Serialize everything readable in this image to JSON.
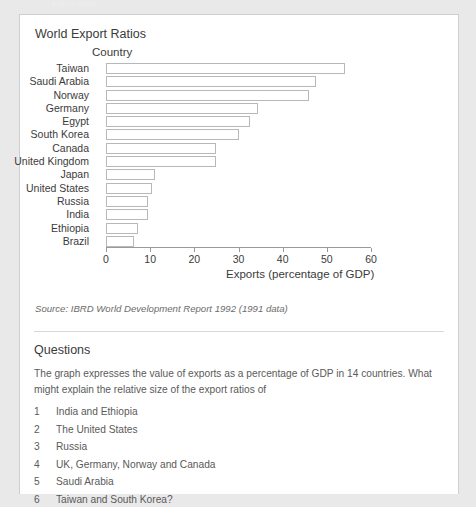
{
  "page": {
    "cut_off_header_text": "Export ratios"
  },
  "chart_data": {
    "type": "bar",
    "orientation": "horizontal",
    "title": "World Export Ratios",
    "ylabel": "Country",
    "xlabel": "Exports (percentage of GDP)",
    "xlim": [
      0,
      60
    ],
    "xticks": [
      0,
      10,
      20,
      30,
      40,
      50,
      60
    ],
    "xtick_labels": [
      "0",
      "10",
      "20",
      "30",
      "40",
      "50",
      "60"
    ],
    "grid": false,
    "legend": false,
    "categories": [
      "Taiwan",
      "Saudi Arabia",
      "Norway",
      "Germany",
      "Egypt",
      "South Korea",
      "Canada",
      "United Kingdom",
      "Japan",
      "United States",
      "Russia",
      "India",
      "Ethiopia",
      "Brazil"
    ],
    "values": [
      54,
      47.5,
      46,
      34.5,
      32.5,
      30,
      25,
      25,
      11,
      10.5,
      9.5,
      9.5,
      7.3,
      6.4
    ],
    "bar_fill": "#ffffff",
    "bar_edge": "#b8b8b8",
    "source": "Source: IBRD World Development Report 1992 (1991 data)"
  },
  "questions": {
    "heading": "Questions",
    "intro": "The graph expresses the value of exports as a percentage of GDP in 14 countries. What might explain the relative size of the export ratios of",
    "items": [
      {
        "num": "1",
        "text": "India and Ethiopia"
      },
      {
        "num": "2",
        "text": "The United States"
      },
      {
        "num": "3",
        "text": "Russia"
      },
      {
        "num": "4",
        "text": "UK, Germany, Norway and Canada"
      },
      {
        "num": "5",
        "text": "Saudi Arabia"
      },
      {
        "num": "6",
        "text": "Taiwan and South Korea?"
      }
    ]
  }
}
